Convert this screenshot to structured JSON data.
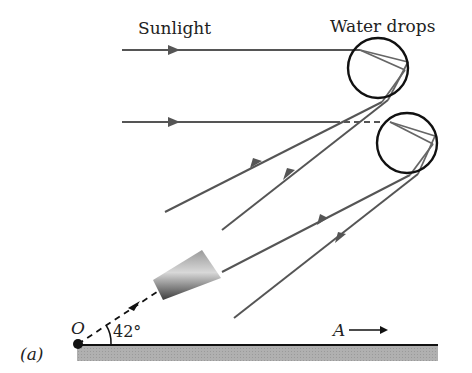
{
  "diagram": {
    "panel_label": "(a)",
    "labels": {
      "sunlight": "Sunlight",
      "water_drops": "Water drops",
      "observer": "O",
      "angle": "42°",
      "direction": "A"
    },
    "colors": {
      "ray": "#555555",
      "drop_outline": "#111111",
      "ground_fill": "#a8a8a8",
      "ground_line": "#111111",
      "background": "#ffffff"
    },
    "elements": {
      "incoming_rays": 2,
      "water_drops": 2,
      "outgoing_rays": 4,
      "viewing_cone": true,
      "ground": true
    }
  }
}
